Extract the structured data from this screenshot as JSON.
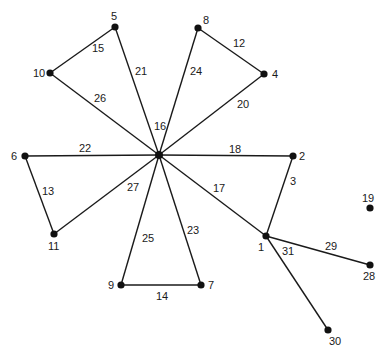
{
  "diagram": {
    "type": "graph",
    "center_label": "16",
    "nodes": [
      {
        "id": "16",
        "x": 159,
        "y": 155,
        "label": "",
        "lx": 0,
        "ly": 0
      },
      {
        "id": "5",
        "x": 115,
        "y": 27,
        "label": "5",
        "lx": 111,
        "ly": 20
      },
      {
        "id": "10",
        "x": 50,
        "y": 73,
        "label": "10",
        "lx": 33,
        "ly": 77
      },
      {
        "id": "8",
        "x": 198,
        "y": 28,
        "label": "8",
        "lx": 203,
        "ly": 24
      },
      {
        "id": "4",
        "x": 264,
        "y": 74,
        "label": "4",
        "lx": 272,
        "ly": 78
      },
      {
        "id": "6",
        "x": 25,
        "y": 156,
        "label": "6",
        "lx": 11,
        "ly": 160
      },
      {
        "id": "2",
        "x": 293,
        "y": 156,
        "label": "2",
        "lx": 299,
        "ly": 160
      },
      {
        "id": "11",
        "x": 54,
        "y": 234,
        "label": "11",
        "lx": 48,
        "ly": 250
      },
      {
        "id": "9",
        "x": 121,
        "y": 285,
        "label": "9",
        "lx": 108,
        "ly": 289
      },
      {
        "id": "7",
        "x": 201,
        "y": 285,
        "label": "7",
        "lx": 208,
        "ly": 289
      },
      {
        "id": "1",
        "x": 266,
        "y": 236,
        "label": "1",
        "lx": 258,
        "ly": 251
      },
      {
        "id": "19",
        "x": 370,
        "y": 208,
        "label": "19",
        "lx": 362,
        "ly": 202
      },
      {
        "id": "28",
        "x": 370,
        "y": 265,
        "label": "28",
        "lx": 363,
        "ly": 280
      },
      {
        "id": "30",
        "x": 328,
        "y": 330,
        "label": "30",
        "lx": 329,
        "ly": 345
      }
    ],
    "edges": [
      {
        "from": "5",
        "to": "10",
        "label": "15",
        "lx": 92,
        "ly": 52
      },
      {
        "from": "5",
        "to": "16",
        "label": "21",
        "lx": 135,
        "ly": 75
      },
      {
        "from": "10",
        "to": "16",
        "label": "26",
        "lx": 94,
        "ly": 102
      },
      {
        "from": "8",
        "to": "16",
        "label": "24",
        "lx": 190,
        "ly": 75
      },
      {
        "from": "8",
        "to": "4",
        "label": "12",
        "lx": 233,
        "ly": 47
      },
      {
        "from": "4",
        "to": "16",
        "label": "20",
        "lx": 237,
        "ly": 108
      },
      {
        "from": "6",
        "to": "16",
        "label": "22",
        "lx": 79,
        "ly": 152
      },
      {
        "from": "16",
        "to": "2",
        "label": "18",
        "lx": 229,
        "ly": 153
      },
      {
        "from": "6",
        "to": "11",
        "label": "13",
        "lx": 42,
        "ly": 195
      },
      {
        "from": "11",
        "to": "16",
        "label": "27",
        "lx": 127,
        "ly": 191
      },
      {
        "from": "9",
        "to": "16",
        "label": "25",
        "lx": 142,
        "ly": 242
      },
      {
        "from": "7",
        "to": "16",
        "label": "23",
        "lx": 187,
        "ly": 234
      },
      {
        "from": "9",
        "to": "7",
        "label": "14",
        "lx": 156,
        "ly": 300
      },
      {
        "from": "16",
        "to": "1",
        "label": "17",
        "lx": 213,
        "ly": 192
      },
      {
        "from": "2",
        "to": "1",
        "label": "3",
        "lx": 290,
        "ly": 185
      },
      {
        "from": "1",
        "to": "28",
        "label": "29",
        "lx": 325,
        "ly": 250
      },
      {
        "from": "1",
        "to": "30",
        "label": "31",
        "lx": 282,
        "ly": 255
      }
    ],
    "hub_label": {
      "text": "16",
      "lx": 154,
      "ly": 130
    },
    "colors": {
      "line": "#1a1a1a",
      "node": "#111111",
      "background": "#ffffff"
    }
  }
}
